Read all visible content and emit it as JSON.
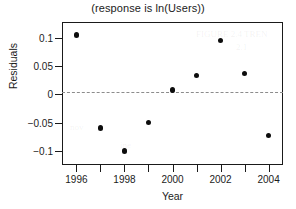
{
  "chart_data": {
    "type": "scatter",
    "title": "(response is ln(Users))",
    "xlabel": "Year",
    "ylabel": "Residuals",
    "x": [
      1996,
      1997,
      1998,
      1999,
      2000,
      2001,
      2002,
      2003,
      2004
    ],
    "values": [
      0.105,
      -0.06,
      -0.1,
      -0.05,
      0.008,
      0.033,
      0.095,
      0.037,
      -0.073
    ],
    "series": [
      {
        "name": "Residuals",
        "values": [
          0.105,
          -0.06,
          -0.1,
          -0.05,
          0.008,
          0.033,
          0.095,
          0.037,
          -0.073
        ]
      }
    ],
    "xlim": [
      1995.4,
      2004.6
    ],
    "ylim": [
      -0.125,
      0.128
    ],
    "xticks": [
      1996,
      1997,
      1998,
      1999,
      2000,
      2001,
      2002,
      2003,
      2004
    ],
    "xtick_labels": [
      "1996",
      "",
      "1998",
      "",
      "2000",
      "",
      "2002",
      "",
      "2004"
    ],
    "yticks": [
      0.1,
      0.05,
      0,
      -0.05,
      -0.1
    ],
    "ytick_labels": [
      "0.1",
      "0.05",
      "0",
      "−0.05",
      "−0.1"
    ],
    "grid": false,
    "legend": false,
    "reference_line": {
      "value": 0,
      "style": "dashed",
      "color": "#8c8c8c"
    },
    "marker": {
      "shape": "circle",
      "filled": true,
      "color": "#0d0d0d"
    },
    "frame_color": "#1a1a1a"
  },
  "artifacts": [
    {
      "text": "FIGURE 2.4 TREN",
      "left": 196,
      "top": 29
    },
    {
      "text": "2.1",
      "left": 236,
      "top": 42
    },
    {
      "text": "nov",
      "left": 70,
      "top": 122
    },
    {
      "text": "ine",
      "left": 120,
      "top": 140
    }
  ]
}
